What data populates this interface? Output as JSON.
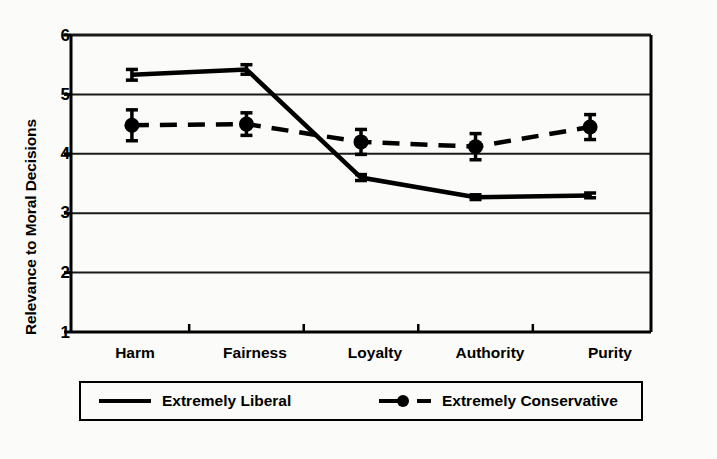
{
  "chart_data": {
    "type": "line",
    "title": "",
    "xlabel": "",
    "ylabel": "Relevance to Moral Decisions",
    "categories": [
      "Harm",
      "Fairness",
      "Loyalty",
      "Authority",
      "Purity"
    ],
    "ylim": [
      1,
      6
    ],
    "yticks": [
      1,
      2,
      3,
      4,
      5,
      6
    ],
    "grid": true,
    "legend_position": "below-axes",
    "series": [
      {
        "name": "Extremely Liberal",
        "style": "solid",
        "marker": "none",
        "color": "#000000",
        "values": [
          5.33,
          5.42,
          3.6,
          3.27,
          3.3
        ],
        "errors": [
          0.09,
          0.08,
          0.05,
          0.04,
          0.04
        ]
      },
      {
        "name": "Extremely Conservative",
        "style": "dashed",
        "marker": "circle",
        "color": "#000000",
        "values": [
          4.48,
          4.5,
          4.2,
          4.12,
          4.45
        ],
        "errors": [
          0.26,
          0.19,
          0.21,
          0.22,
          0.21
        ]
      }
    ]
  },
  "axes": {
    "y_title": "Relevance to Moral Decisions",
    "y_tick_labels": [
      "6",
      "5",
      "4",
      "3",
      "2",
      "1"
    ],
    "x_tick_labels": [
      "Harm",
      "Fairness",
      "Loyalty",
      "Authority",
      "Purity"
    ]
  },
  "legend": {
    "items": [
      {
        "label": "Extremely Liberal",
        "swatch": "solid-line-swatch"
      },
      {
        "label": "Extremely Conservative",
        "swatch": "dashed-line-circle-swatch"
      }
    ]
  },
  "colors": {
    "ink": "#000000",
    "background": "#fbfbf9",
    "grid": "#1a1a1a"
  }
}
